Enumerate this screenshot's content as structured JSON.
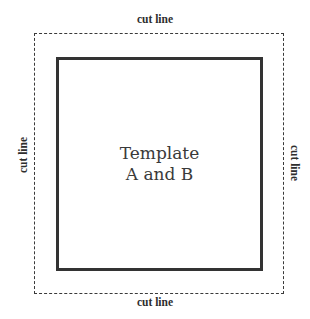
{
  "diagram": {
    "center_label": {
      "line1": "Template",
      "line2": "A and B"
    },
    "cut_labels": {
      "top": "cut line",
      "bottom": "cut line",
      "left": "cut line",
      "right": "cut line"
    },
    "colors": {
      "background": "#ffffff",
      "solid_border": "#333333",
      "dashed_border": "#3a3a3a",
      "text": "#3a3a3a"
    }
  }
}
